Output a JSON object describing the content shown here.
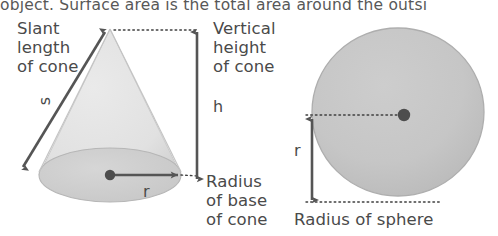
{
  "page": {
    "background_color": "#ffffff"
  },
  "header": {
    "text": "object. Surface area is the total area around the outsi",
    "color": "#585858",
    "note": "line is clipped at top and right edges of the screenshot"
  },
  "colors": {
    "shape_fill_light": "#e3e3e3",
    "shape_fill_mid": "#cfcfcf",
    "shape_stroke": "#b4b4b4",
    "arrow": "#555555",
    "dot": "#4d4d4d",
    "text": "#4a4a4a",
    "dotted_line": "#3f3f3f"
  },
  "cone": {
    "name": "cone",
    "labels": {
      "slant": "Slant\nlength\nof cone",
      "slant_symbol": "s",
      "vertical": "Vertical\nheight\nof cone",
      "vertical_symbol": "h",
      "radius": "Radius\nof base\nof cone",
      "radius_symbol": "r"
    },
    "geometry": {
      "apex": [
        110,
        29
      ],
      "base_center": [
        110,
        175
      ],
      "base_rx": 71,
      "base_ry": 27,
      "slant_arrow": {
        "from": [
          22,
          168
        ],
        "to": [
          106,
          31
        ],
        "heads": "both"
      },
      "height_arrow": {
        "from": [
          197,
          180
        ],
        "to": [
          197,
          31
        ],
        "heads": "both"
      },
      "radius_arrow": {
        "from": [
          110,
          175
        ],
        "to": [
          182,
          175
        ],
        "heads": "end"
      },
      "dotted_apex_line": {
        "from": [
          112,
          30
        ],
        "to": [
          197,
          30
        ]
      },
      "dotted_radius_line": {
        "from": [
          182,
          175
        ],
        "to": [
          199,
          175
        ]
      }
    }
  },
  "sphere": {
    "name": "sphere",
    "labels": {
      "caption": "Radius of sphere",
      "radius_symbol": "r"
    },
    "geometry": {
      "center": [
        398,
        112
      ],
      "rx": 86,
      "ry": 84,
      "center_dot": [
        404,
        115
      ],
      "radius_arrow": {
        "from": [
          312,
          118
        ],
        "to": [
          312,
          202
        ],
        "heads": "both"
      },
      "dotted_center_line": {
        "from": [
          306,
          115
        ],
        "to": [
          404,
          115
        ]
      },
      "dotted_bottom_line": {
        "from": [
          306,
          202
        ],
        "to": [
          440,
          202
        ]
      }
    }
  }
}
